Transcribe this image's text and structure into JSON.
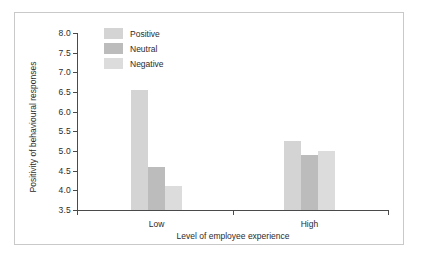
{
  "chart_data": {
    "type": "bar",
    "title": "",
    "xlabel": "Level of employee experience",
    "ylabel": "Positivity of behavioural responses",
    "categories": [
      "Low",
      "High"
    ],
    "series": [
      {
        "name": "Positive",
        "values": [
          6.55,
          5.25
        ],
        "color": "#d4d4d4"
      },
      {
        "name": "Neutral",
        "values": [
          4.6,
          4.9
        ],
        "color": "#bcbcbc"
      },
      {
        "name": "Negative",
        "values": [
          4.1,
          5.0
        ],
        "color": "#dcdcdc"
      }
    ],
    "ylim": [
      3.5,
      8.0
    ],
    "ytick_labels": [
      "8.0",
      "7.5",
      "7.0",
      "6.5",
      "6.0",
      "5.5",
      "5.0",
      "4.5",
      "4.0",
      "3.5"
    ],
    "ytick_values": [
      8.0,
      7.5,
      7.0,
      6.5,
      6.0,
      5.5,
      5.0,
      4.5,
      4.0,
      3.5
    ],
    "grid": false,
    "legend_position": "top-left-inside"
  },
  "figure": {
    "border_color": "#c9c9c9",
    "background": "#ffffff",
    "axis_color": "#4a4a4a",
    "text_color": "#2b2b2b"
  }
}
